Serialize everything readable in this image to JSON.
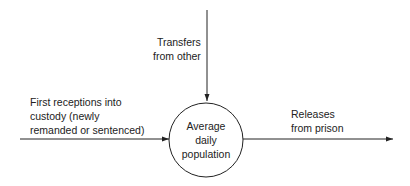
{
  "diagram": {
    "center_node": {
      "line1": "Average",
      "line2": "daily",
      "line3": "population"
    },
    "inflow_top": {
      "line1": "Transfers",
      "line2": "from other"
    },
    "inflow_left": {
      "line1": "First receptions into",
      "line2": "custody (newly",
      "line3": "remanded or sentenced)"
    },
    "outflow_right": {
      "line1": "Releases",
      "line2": "from prison"
    },
    "colors": {
      "line": "#222222",
      "background": "#ffffff"
    }
  }
}
